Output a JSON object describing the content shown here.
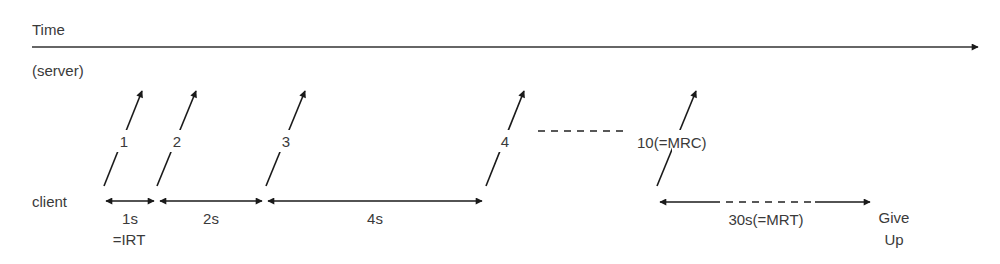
{
  "axis": {
    "time_label": "Time",
    "server_label": "(server)",
    "client_label": "client"
  },
  "transmissions": [
    {
      "label": "1"
    },
    {
      "label": "2"
    },
    {
      "label": "3"
    },
    {
      "label": "4"
    },
    {
      "label": "10(=MRC)"
    }
  ],
  "ellipsis": "- - - - - - -",
  "intervals": [
    {
      "label": "1s",
      "sublabel": "=IRT"
    },
    {
      "label": "2s"
    },
    {
      "label": "4s"
    },
    {
      "label": "30s(=MRT)"
    }
  ],
  "give_up": {
    "line1": "Give",
    "line2": "Up"
  },
  "colors": {
    "line": "#1a1a1a",
    "text": "#3a3a3a",
    "background": "#ffffff"
  }
}
